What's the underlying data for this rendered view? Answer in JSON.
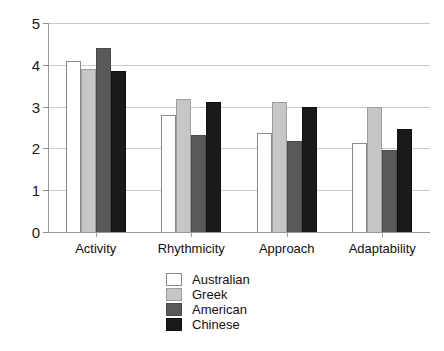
{
  "chart_data": {
    "type": "bar",
    "title": "",
    "subtitle": "",
    "xlabel": "",
    "ylabel": "",
    "ylim": [
      0,
      5
    ],
    "ytick_labels": [
      "5",
      "4",
      "3",
      "2",
      "1",
      "0"
    ],
    "yticks": [
      5,
      4,
      3,
      2,
      1,
      0
    ],
    "grid": true,
    "legend_position": "bottom-center",
    "categories": [
      "Activity",
      "Rhythmicity",
      "Approach",
      "Adaptability"
    ],
    "series": [
      {
        "name": "Australian",
        "color": "#ffffff",
        "values": [
          4.1,
          2.8,
          2.37,
          2.12
        ]
      },
      {
        "name": "Greek",
        "color": "#c6c6c6",
        "values": [
          3.9,
          3.18,
          3.1,
          2.98
        ]
      },
      {
        "name": "American",
        "color": "#595959",
        "values": [
          4.4,
          2.33,
          2.18,
          1.97
        ]
      },
      {
        "name": "Chinese",
        "color": "#1a1a1a",
        "values": [
          3.85,
          3.1,
          2.98,
          2.47
        ]
      }
    ]
  },
  "legend": {
    "items": [
      {
        "label": "Australian",
        "swatch": "australian"
      },
      {
        "label": "Greek",
        "swatch": "greek"
      },
      {
        "label": "American",
        "swatch": "american"
      },
      {
        "label": "Chinese",
        "swatch": "chinese"
      }
    ]
  },
  "colors": {
    "gridline": "#c9c9c9",
    "axis": "#9a9a9a",
    "text": "#111111",
    "background": "#ffffff"
  }
}
